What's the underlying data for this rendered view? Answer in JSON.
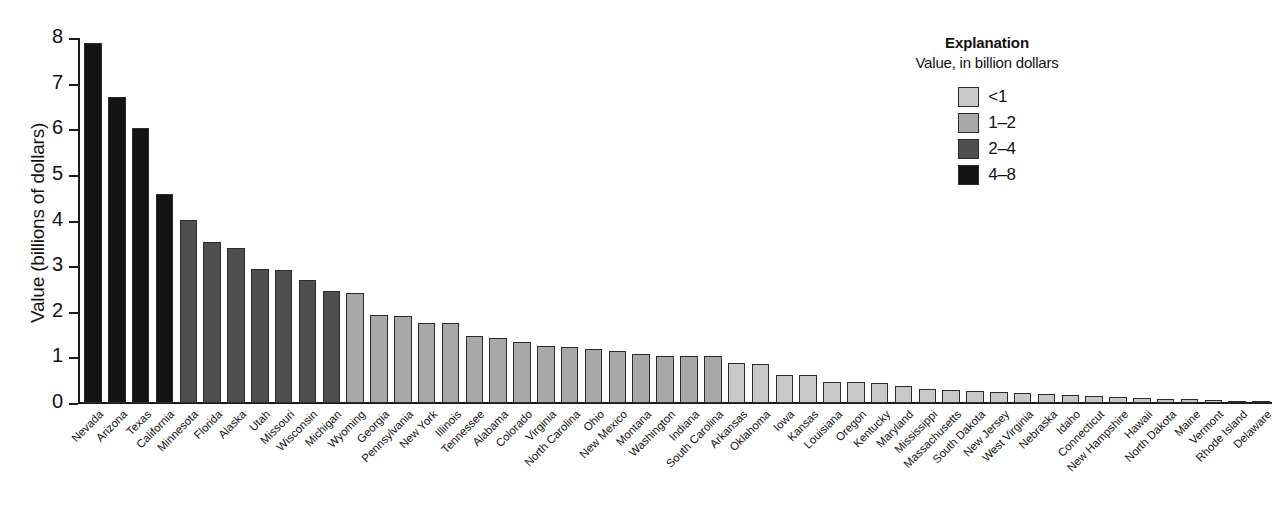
{
  "chart_data": {
    "type": "bar",
    "title": "",
    "xlabel": "",
    "ylabel": "Value (billions of dollars)",
    "ylim": [
      0,
      8
    ],
    "yticks": [
      "0",
      "1",
      "2",
      "3",
      "4",
      "5",
      "6",
      "7",
      "8"
    ],
    "grid": false,
    "legend_position": "top-right",
    "categories": [
      "Nevada",
      "Arizona",
      "Texas",
      "California",
      "Minnesota",
      "Florida",
      "Alaska",
      "Utah",
      "Missouri",
      "Wisconsin",
      "Michigan",
      "Wyoming",
      "Georgia",
      "Pennsylvania",
      "New York",
      "Illinois",
      "Tennessee",
      "Alabama",
      "Colorado",
      "Virginia",
      "North Carolina",
      "Ohio",
      "New Mexico",
      "Montana",
      "Washington",
      "Indiana",
      "South Carolina",
      "Arkansas",
      "Oklahoma",
      "Iowa",
      "Kansas",
      "Louisiana",
      "Oregon",
      "Kentucky",
      "Maryland",
      "Mississippi",
      "Massachusetts",
      "South Dakota",
      "New Jersey",
      "West Virginia",
      "Nebraska",
      "Idaho",
      "Connecticut",
      "New Hampshire",
      "Hawaii",
      "North Dakota",
      "Maine",
      "Vermont",
      "Rhode Island",
      "Delaware"
    ],
    "values": [
      7.9,
      6.7,
      6.03,
      4.58,
      4.02,
      3.54,
      3.4,
      2.94,
      2.91,
      2.69,
      2.45,
      2.41,
      1.94,
      1.9,
      1.76,
      1.75,
      1.46,
      1.42,
      1.33,
      1.26,
      1.22,
      1.18,
      1.15,
      1.08,
      1.04,
      1.02,
      1.02,
      0.88,
      0.85,
      0.62,
      0.61,
      0.47,
      0.47,
      0.44,
      0.37,
      0.3,
      0.28,
      0.26,
      0.24,
      0.21,
      0.19,
      0.18,
      0.15,
      0.13,
      0.1,
      0.09,
      0.08,
      0.06,
      0.04,
      0.02
    ],
    "bin_classes": [
      "4-8",
      "4-8",
      "4-8",
      "4-8",
      "2-4",
      "2-4",
      "2-4",
      "2-4",
      "2-4",
      "2-4",
      "2-4",
      "1-2",
      "1-2",
      "1-2",
      "1-2",
      "1-2",
      "1-2",
      "1-2",
      "1-2",
      "1-2",
      "1-2",
      "1-2",
      "1-2",
      "1-2",
      "1-2",
      "1-2",
      "1-2",
      "<1",
      "<1",
      "<1",
      "<1",
      "<1",
      "<1",
      "<1",
      "<1",
      "<1",
      "<1",
      "<1",
      "<1",
      "<1",
      "<1",
      "<1",
      "<1",
      "<1",
      "<1",
      "<1",
      "<1",
      "<1",
      "<1",
      "<1"
    ]
  },
  "legend": {
    "title": "Explanation",
    "subtitle": "Value, in billion dollars",
    "items": [
      {
        "label": "<1",
        "color": "#c9c9c9"
      },
      {
        "label": "1–2",
        "color": "#a8a8a8"
      },
      {
        "label": "2–4",
        "color": "#4f4f4f"
      },
      {
        "label": "4–8",
        "color": "#141414"
      }
    ]
  },
  "colors": {
    "bin_lt1": "#c9c9c9",
    "bin_1_2": "#a8a8a8",
    "bin_2_4": "#4f4f4f",
    "bin_4_8": "#141414",
    "axis": "#1a1a1a",
    "text": "#111111",
    "background": "#ffffff"
  }
}
